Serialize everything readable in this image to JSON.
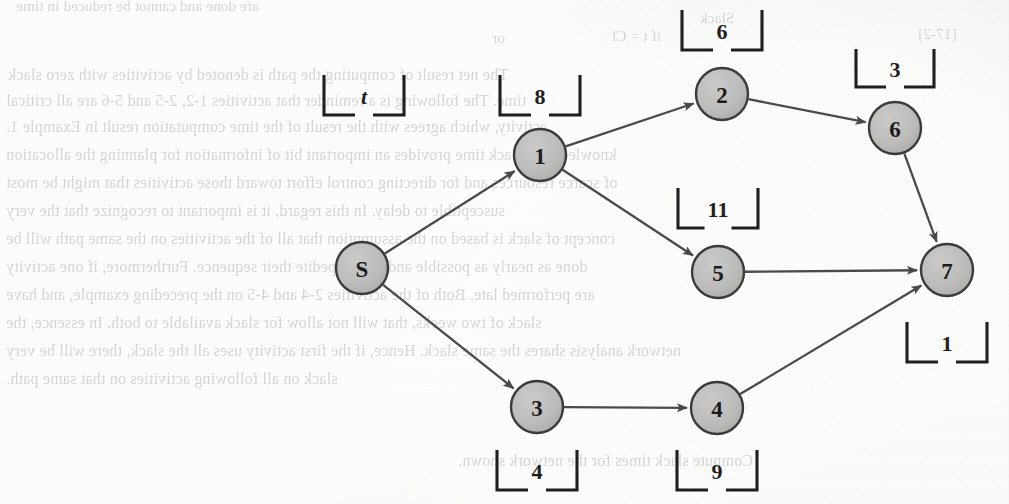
{
  "page": {
    "kind": "scanned-textbook-figure",
    "figure_type": "activity-network-diagram",
    "background_color": "#f1f1ee",
    "node_fill": "#b9b9b7",
    "node_stroke": "#3b3b3b",
    "edge_color": "#4a4a4a",
    "label_color": "#1f1f1f"
  },
  "chart_data": {
    "type": "diagram",
    "title": "",
    "nodes": [
      {
        "id": "S",
        "label": "S",
        "x": 362,
        "y": 268,
        "r": 26
      },
      {
        "id": "1",
        "label": "1",
        "x": 540,
        "y": 155,
        "r": 26
      },
      {
        "id": "2",
        "label": "2",
        "x": 722,
        "y": 94,
        "r": 26
      },
      {
        "id": "3",
        "label": "3",
        "x": 537,
        "y": 407,
        "r": 26
      },
      {
        "id": "4",
        "label": "4",
        "x": 717,
        "y": 408,
        "r": 26
      },
      {
        "id": "5",
        "label": "5",
        "x": 718,
        "y": 272,
        "r": 26
      },
      {
        "id": "6",
        "label": "6",
        "x": 895,
        "y": 128,
        "r": 26
      },
      {
        "id": "7",
        "label": "7",
        "x": 947,
        "y": 270,
        "r": 26
      }
    ],
    "edges": [
      {
        "from": "S",
        "to": "1",
        "arrow": true
      },
      {
        "from": "S",
        "to": "3",
        "arrow": true
      },
      {
        "from": "1",
        "to": "2",
        "arrow": true
      },
      {
        "from": "1",
        "to": "5",
        "arrow": true
      },
      {
        "from": "2",
        "to": "6",
        "arrow": true
      },
      {
        "from": "3",
        "to": "4",
        "arrow": true
      },
      {
        "from": "4",
        "to": "7",
        "arrow": true
      },
      {
        "from": "5",
        "to": "7",
        "arrow": true
      },
      {
        "from": "6",
        "to": "7",
        "arrow": true
      }
    ],
    "bracket_labels": [
      {
        "id": "bracket-t",
        "text": "t",
        "italic": true,
        "x": 364,
        "y": 95,
        "w": 80,
        "h": 40,
        "orient": "up",
        "describes": "edge-S-1"
      },
      {
        "id": "bracket-8",
        "text": "8",
        "italic": false,
        "x": 540,
        "y": 95,
        "w": 80,
        "h": 40,
        "orient": "up",
        "describes": "node-1"
      },
      {
        "id": "bracket-6",
        "text": "6",
        "italic": false,
        "x": 722,
        "y": 30,
        "w": 80,
        "h": 40,
        "orient": "up",
        "describes": "node-2"
      },
      {
        "id": "bracket-3",
        "text": "3",
        "italic": false,
        "x": 895,
        "y": 68,
        "w": 78,
        "h": 38,
        "orient": "up",
        "describes": "node-6"
      },
      {
        "id": "bracket-11",
        "text": "11",
        "italic": false,
        "x": 718,
        "y": 208,
        "w": 80,
        "h": 40,
        "orient": "up",
        "describes": "node-5"
      },
      {
        "id": "bracket-1",
        "text": "1",
        "italic": false,
        "x": 947,
        "y": 342,
        "w": 80,
        "h": 40,
        "orient": "up",
        "describes": "node-7"
      },
      {
        "id": "bracket-4",
        "text": "4",
        "italic": false,
        "x": 537,
        "y": 470,
        "w": 80,
        "h": 40,
        "orient": "up",
        "describes": "node-3"
      },
      {
        "id": "bracket-9",
        "text": "9",
        "italic": false,
        "x": 717,
        "y": 470,
        "w": 80,
        "h": 40,
        "orient": "up",
        "describes": "node-4"
      }
    ]
  },
  "bleed_text": {
    "note": "faint mirrored show-through text from the reverse of the scanned page",
    "lines": [
      {
        "text": "are done and cannot be reduced in time",
        "x": 16,
        "y": -2,
        "size": 15,
        "mirror": true
      },
      {
        "text": "Slack",
        "x": 700,
        "y": 10,
        "size": 15,
        "mirror": true
      },
      {
        "text": "or",
        "x": 492,
        "y": 30,
        "size": 15,
        "mirror": true
      },
      {
        "text": "if  t = Cl",
        "x": 612,
        "y": 28,
        "size": 15,
        "mirror": true
      },
      {
        "text": "[17-2]",
        "x": 918,
        "y": 26,
        "size": 15,
        "mirror": true
      },
      {
        "text": "The net result of computing the path is denoted by  activities  with zero slack",
        "x": 8,
        "y": 66,
        "size": 16,
        "mirror": true
      },
      {
        "text": "time.  The following  is a reminder that  activities 1-2,  2-5  and 5-6 are all critical",
        "x": 6,
        "y": 92,
        "size": 16,
        "mirror": true
      },
      {
        "text": "activity, which agrees with the result  of  the  time  computation  result in  Example 1.",
        "x": 6,
        "y": 118,
        "size": 16,
        "mirror": true
      },
      {
        "text": "knowledge of slack time provides  an important  bit  of information for planning the allocation",
        "x": 6,
        "y": 146,
        "size": 16,
        "mirror": true
      },
      {
        "text": "of scarce resources and for directing control effort toward those activities that might be most",
        "x": 6,
        "y": 174,
        "size": 16,
        "mirror": true
      },
      {
        "text": "susceptible to delay.  In this regard, it is important to recognize that the very",
        "x": 6,
        "y": 202,
        "size": 16,
        "mirror": true
      },
      {
        "text": "concept of slack is based on the assumption that all of the activities  on the same path will be",
        "x": 6,
        "y": 230,
        "size": 16,
        "mirror": true
      },
      {
        "text": "done as nearly as possible and may expedite their sequence. Furthermore, if  one activity",
        "x": 6,
        "y": 258,
        "size": 16,
        "mirror": true
      },
      {
        "text": "are performed  late.  Both of the activities 2-4 and 4-5 on the preceding example, and have",
        "x": 6,
        "y": 286,
        "size": 16,
        "mirror": true
      },
      {
        "text": "slack  of  two weeks, that will not allow for slack available to both. In essence, the",
        "x": 6,
        "y": 314,
        "size": 16,
        "mirror": true
      },
      {
        "text": "network analysis  shares the same slack. Hence, if the first activity uses all the slack, there will be very",
        "x": 6,
        "y": 342,
        "size": 16,
        "mirror": true
      },
      {
        "text": "slack on all following activities on that same path.",
        "x": 6,
        "y": 370,
        "size": 16,
        "mirror": true
      },
      {
        "text": "Compute  slack  times  for  the  network  shown.",
        "x": 458,
        "y": 452,
        "size": 16,
        "mirror": true
      }
    ]
  }
}
